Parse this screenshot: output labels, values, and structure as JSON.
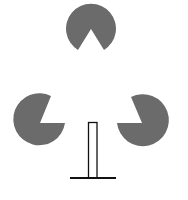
{
  "figure": {
    "colors": {
      "disc_fill": "#6b6b6b",
      "stroke": "#111111",
      "background": "#ffffff"
    },
    "shapes": [
      {
        "name": "top-notched-disc",
        "cx": 91,
        "cy": 28,
        "r": 25,
        "notch": "downward"
      },
      {
        "name": "left-notched-disc",
        "cx": 39,
        "cy": 119,
        "r": 26,
        "notch": "upper-right"
      },
      {
        "name": "right-notched-disc",
        "cx": 143,
        "cy": 120,
        "r": 26,
        "notch": "upper-left"
      },
      {
        "name": "vertical-post",
        "x": 88,
        "y": 122,
        "w": 9,
        "h": 56
      },
      {
        "name": "base-line",
        "x1": 70,
        "x2": 116,
        "y": 178
      }
    ]
  }
}
